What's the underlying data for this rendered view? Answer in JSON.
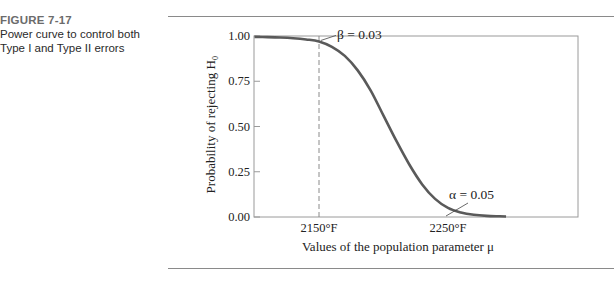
{
  "figure": {
    "number": "FIGURE 7-17",
    "caption": "Power curve to control both Type I and Type II errors"
  },
  "chart_data": {
    "type": "line",
    "title": "",
    "xlabel": "Values of the population parameter μ",
    "ylabel": "Probability of rejecting H₀",
    "ylim": [
      0,
      1
    ],
    "xlim": [
      2100,
      2350
    ],
    "y_ticks": [
      "0.00",
      "0.25",
      "0.50",
      "0.75",
      "1.00"
    ],
    "y_tick_values": [
      0,
      0.25,
      0.5,
      0.75,
      1.0
    ],
    "x_ticks": [
      "2150°F",
      "2250°F"
    ],
    "x_tick_values": [
      2150,
      2250
    ],
    "grid": false,
    "series": [
      {
        "name": "Power curve",
        "color": "#5a5a5a",
        "x": [
          2100,
          2110,
          2120,
          2130,
          2140,
          2150,
          2160,
          2170,
          2180,
          2190,
          2200,
          2210,
          2220,
          2230,
          2240,
          2250,
          2260,
          2270,
          2280,
          2290,
          2295
        ],
        "y": [
          0.995,
          0.994,
          0.992,
          0.988,
          0.981,
          0.97,
          0.94,
          0.89,
          0.81,
          0.7,
          0.56,
          0.42,
          0.29,
          0.18,
          0.1,
          0.05,
          0.025,
          0.012,
          0.006,
          0.004,
          0.003
        ]
      }
    ],
    "reference_lines": [
      {
        "axis": "x",
        "value": 2150,
        "style": "dashed"
      }
    ],
    "annotations": [
      {
        "text": "β = 0.03",
        "x": 2150,
        "y": 0.97
      },
      {
        "text": "α = 0.05",
        "x": 2250,
        "y": 0.05
      }
    ]
  }
}
